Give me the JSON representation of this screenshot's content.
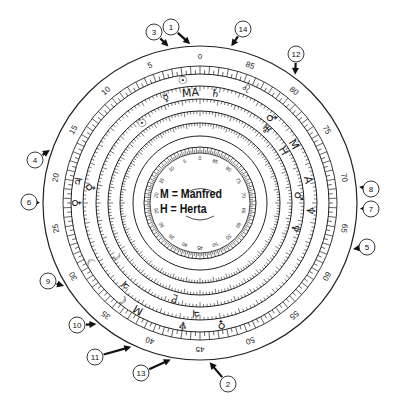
{
  "diagram": {
    "type": "astrological-dial",
    "scale_labels": [
      "0",
      "5",
      "10",
      "15",
      "20",
      "25",
      "30",
      "35",
      "40",
      "45",
      "50",
      "55",
      "60",
      "65",
      "70",
      "75",
      "80",
      "85"
    ],
    "inner_scale_labels": [
      "0",
      "5",
      "10",
      "15",
      "20",
      "25",
      "30",
      "35",
      "40",
      "45",
      "50",
      "55",
      "60",
      "65",
      "70",
      "75",
      "80",
      "85"
    ],
    "legend": {
      "m_line": "M = Manfred",
      "h_line": "H = Herta"
    },
    "ring_symbols": [
      {
        "glyph": "☉",
        "angle": -8,
        "ring": 1
      },
      {
        "glyph": "♌",
        "angle": 22,
        "ring": 1
      },
      {
        "glyph": "MA",
        "angle": -5,
        "ring": 2
      },
      {
        "glyph": "♄",
        "angle": 8,
        "ring": 2
      },
      {
        "glyph": "☿",
        "angle": -18,
        "ring": 2
      },
      {
        "glyph": "☉",
        "angle": -36,
        "ring": 3
      },
      {
        "glyph": "♂",
        "angle": 40,
        "ring": 2
      },
      {
        "glyph": "♅",
        "angle": 42,
        "ring": 3
      },
      {
        "glyph": "M",
        "angle": 58,
        "ring": 2
      },
      {
        "glyph": "H",
        "angle": 58,
        "ring": 3
      },
      {
        "glyph": "A",
        "angle": 78,
        "ring": 2
      },
      {
        "glyph": "♂",
        "angle": 86,
        "ring": 3
      },
      {
        "glyph": "♆",
        "angle": 94,
        "ring": 2
      },
      {
        "glyph": "♆",
        "angle": 105,
        "ring": 3
      },
      {
        "glyph": "♃",
        "angle": -80,
        "ring": 1
      },
      {
        "glyph": "♀",
        "angle": -82,
        "ring": 2
      },
      {
        "glyph": "♀",
        "angle": -90,
        "ring": 1
      },
      {
        "glyph": "☽",
        "angle": -119,
        "ring": 1
      },
      {
        "glyph": "☾",
        "angle": -122,
        "ring": 3
      },
      {
        "glyph": "♃",
        "angle": -138,
        "ring": 2
      },
      {
        "glyph": "☾",
        "angle": -141,
        "ring": 1
      },
      {
        "glyph": "M",
        "angle": -150,
        "ring": 1
      },
      {
        "glyph": "♇",
        "angle": -165,
        "ring": 3
      },
      {
        "glyph": "♃",
        "angle": -178,
        "ring": 2
      },
      {
        "glyph": "♀",
        "angle": 170,
        "ring": 1
      },
      {
        "glyph": "♆",
        "angle": -172,
        "ring": 1
      }
    ],
    "callouts": [
      {
        "label": "1",
        "x": 171,
        "y": 27,
        "angle_target": -3
      },
      {
        "label": "2",
        "x": 228,
        "y": 384,
        "angle_target": 177
      },
      {
        "label": "3",
        "x": 154,
        "y": 32,
        "angle_target": -11
      },
      {
        "label": "4",
        "x": 35,
        "y": 160,
        "angle_target": -70
      },
      {
        "label": "5",
        "x": 367,
        "y": 247,
        "angle_target": 107
      },
      {
        "label": "6",
        "x": 29,
        "y": 202,
        "angle_target": -90
      },
      {
        "label": "7",
        "x": 371,
        "y": 209,
        "angle_target": 92
      },
      {
        "label": "8",
        "x": 371,
        "y": 189,
        "angle_target": 84
      },
      {
        "label": "9",
        "x": 48,
        "y": 281,
        "angle_target": -122
      },
      {
        "label": "10",
        "x": 77,
        "y": 325,
        "angle_target": -140
      },
      {
        "label": "11",
        "x": 95,
        "y": 357,
        "angle_target": -155
      },
      {
        "label": "12",
        "x": 296,
        "y": 54,
        "angle_target": 37
      },
      {
        "label": "13",
        "x": 141,
        "y": 373,
        "angle_target": -170
      },
      {
        "label": "14",
        "x": 243,
        "y": 29,
        "angle_target": 11
      }
    ]
  }
}
